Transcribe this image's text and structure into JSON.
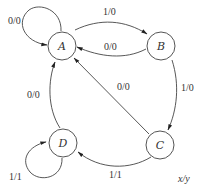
{
  "diagram": {
    "type": "state-machine",
    "legend": "x/y",
    "states": [
      {
        "id": "A",
        "label": "A"
      },
      {
        "id": "B",
        "label": "B"
      },
      {
        "id": "C",
        "label": "C"
      },
      {
        "id": "D",
        "label": "D"
      }
    ],
    "transitions": [
      {
        "from": "A",
        "to": "A",
        "label": "0/0"
      },
      {
        "from": "A",
        "to": "B",
        "label": "1/0"
      },
      {
        "from": "B",
        "to": "A",
        "label": "0/0"
      },
      {
        "from": "B",
        "to": "C",
        "label": "1/0"
      },
      {
        "from": "C",
        "to": "A",
        "label": "0/0"
      },
      {
        "from": "C",
        "to": "D",
        "label": "1/1"
      },
      {
        "from": "D",
        "to": "A",
        "label": "0/0"
      },
      {
        "from": "D",
        "to": "D",
        "label": "1/1"
      }
    ]
  }
}
